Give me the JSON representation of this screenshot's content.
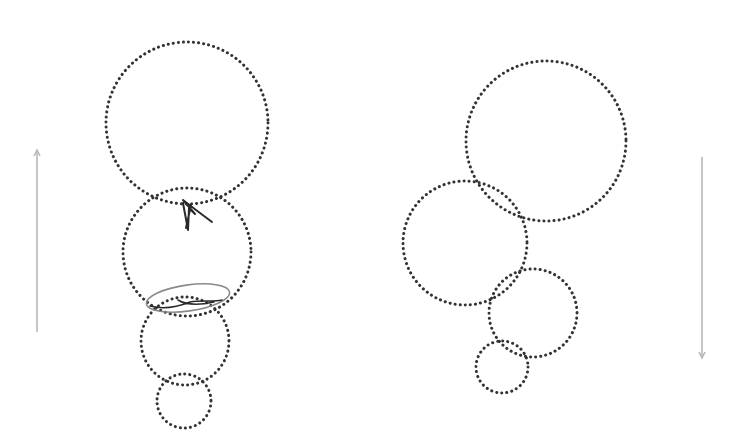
{
  "diagram": {
    "background": "#ffffff",
    "dot_color": "#333333",
    "arrow_color": "#b8b8b8",
    "stroke_dark": "#2a2a2a",
    "stroke_gray": "#8a8a8a",
    "left_stack": {
      "direction": "up",
      "circles": [
        {
          "cx": 187,
          "cy": 123,
          "r": 81
        },
        {
          "cx": 187,
          "cy": 252,
          "r": 64
        },
        {
          "cx": 185,
          "cy": 341,
          "r": 44
        },
        {
          "cx": 184,
          "cy": 401,
          "r": 27
        }
      ]
    },
    "right_stack": {
      "direction": "down",
      "circles": [
        {
          "cx": 546,
          "cy": 141,
          "r": 80
        },
        {
          "cx": 465,
          "cy": 243,
          "r": 62
        },
        {
          "cx": 533,
          "cy": 313,
          "r": 44
        },
        {
          "cx": 502,
          "cy": 367,
          "r": 26
        }
      ]
    },
    "left_arrow": {
      "x": 37,
      "y1": 150,
      "y2": 332,
      "head": "top"
    },
    "right_arrow": {
      "x": 702,
      "y1": 157,
      "y2": 358,
      "head": "bottom"
    }
  }
}
